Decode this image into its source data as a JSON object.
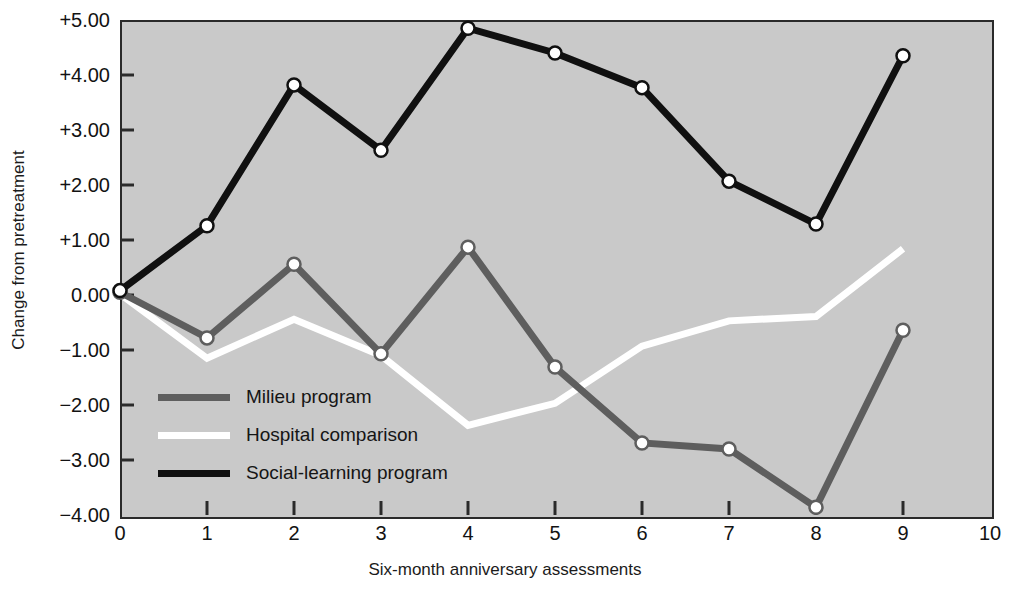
{
  "chart_data": {
    "type": "line",
    "title": "",
    "xlabel": "Six-month anniversary assessments",
    "ylabel": "Change from pretreatment",
    "xlim": [
      0,
      10
    ],
    "ylim": [
      -4.0,
      5.0
    ],
    "xticks": [
      "0",
      "1",
      "2",
      "3",
      "4",
      "5",
      "6",
      "7",
      "8",
      "9",
      "10"
    ],
    "yticks": [
      "+5.00",
      "+4.00",
      "+3.00",
      "+2.00",
      "+1.00",
      "0.00",
      "-1.00",
      "-2.00",
      "-3.00",
      "-4.00"
    ],
    "grid": false,
    "legend_position": "inside-lower-left",
    "x": [
      0,
      1,
      2,
      3,
      4,
      5,
      6,
      7,
      8,
      9
    ],
    "series": [
      {
        "name": "Milieu program",
        "color": "#5e5e5e",
        "marker": "circle-open",
        "values": [
          0.05,
          -0.78,
          0.56,
          -1.07,
          0.87,
          -1.31,
          -2.69,
          -2.8,
          -3.86,
          -0.64
        ]
      },
      {
        "name": "Hospital comparison",
        "color": "#ffffff",
        "marker": "none",
        "values": [
          0.02,
          -1.15,
          -0.44,
          -1.1,
          -2.37,
          -1.97,
          -0.93,
          -0.47,
          -0.39,
          0.84
        ]
      },
      {
        "name": "Social-learning program",
        "color": "#101010",
        "marker": "circle-open",
        "values": [
          0.08,
          1.26,
          3.82,
          2.63,
          4.85,
          4.4,
          3.77,
          2.07,
          1.29,
          4.35
        ]
      }
    ]
  },
  "legend": {
    "items": [
      {
        "label": "Milieu program",
        "color": "#5e5e5e"
      },
      {
        "label": "Hospital comparison",
        "color": "#ffffff"
      },
      {
        "label": "Social-learning program",
        "color": "#101010"
      }
    ]
  },
  "colors": {
    "plot_background": "#c9c9c9",
    "frame": "#2a2a2a",
    "text": "#121212",
    "marker_fill": "#ffffff"
  }
}
